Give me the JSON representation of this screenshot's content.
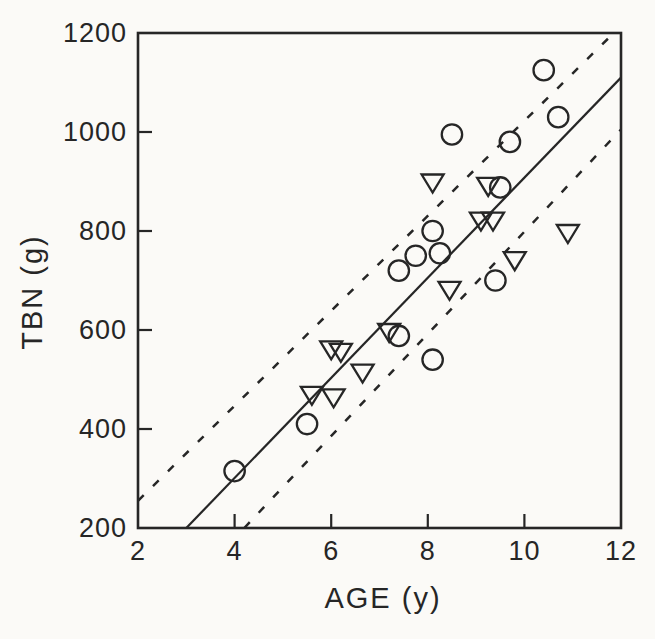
{
  "colors": {
    "ink": "#262626",
    "paper": "#fbfaf7"
  },
  "chart_data": {
    "type": "scatter",
    "title": "",
    "xlabel": "AGE (y)",
    "ylabel": "TBN (g)",
    "xlim": [
      2,
      12
    ],
    "ylim": [
      200,
      1200
    ],
    "x_ticks": [
      2,
      4,
      6,
      8,
      10,
      12
    ],
    "y_ticks": [
      200,
      400,
      600,
      800,
      1000,
      1200
    ],
    "grid": false,
    "legend_position": "none",
    "series": [
      {
        "name": "circle-group",
        "marker": "circle",
        "points": [
          [
            4.0,
            315
          ],
          [
            5.5,
            410
          ],
          [
            7.4,
            588
          ],
          [
            8.1,
            540
          ],
          [
            7.4,
            720
          ],
          [
            7.75,
            750
          ],
          [
            8.25,
            755
          ],
          [
            8.1,
            800
          ],
          [
            9.4,
            700
          ],
          [
            9.5,
            888
          ],
          [
            9.7,
            980
          ],
          [
            8.5,
            995
          ],
          [
            10.7,
            1030
          ],
          [
            10.4,
            1125
          ]
        ]
      },
      {
        "name": "triangle-group",
        "marker": "triangle-down",
        "points": [
          [
            5.6,
            468
          ],
          [
            6.05,
            463
          ],
          [
            6.0,
            560
          ],
          [
            6.2,
            555
          ],
          [
            6.65,
            513
          ],
          [
            7.2,
            595
          ],
          [
            8.45,
            680
          ],
          [
            8.1,
            897
          ],
          [
            9.25,
            890
          ],
          [
            9.1,
            820
          ],
          [
            9.35,
            820
          ],
          [
            9.8,
            740
          ],
          [
            10.9,
            795
          ]
        ]
      }
    ],
    "lines": [
      {
        "name": "regression-line",
        "style": "solid",
        "from": [
          3.0,
          200
        ],
        "to": [
          12.0,
          1110
        ]
      },
      {
        "name": "upper-confidence-line",
        "style": "dashed",
        "from": [
          2.0,
          255
        ],
        "to": [
          11.85,
          1200
        ]
      },
      {
        "name": "lower-confidence-line",
        "style": "dashed",
        "from": [
          4.2,
          200
        ],
        "to": [
          12.0,
          1005
        ]
      }
    ]
  }
}
